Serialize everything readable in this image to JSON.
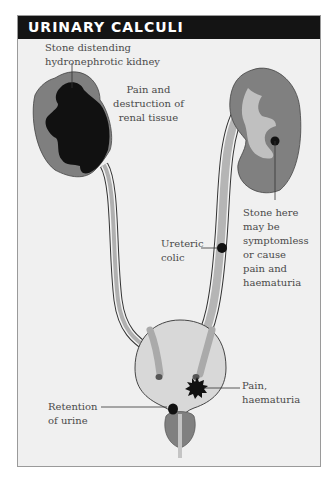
{
  "header": {
    "title": "URINARY CALCULI"
  },
  "labels": {
    "hydro_line1": "Stone distending",
    "hydro_line2": "hydronephrotic kidney",
    "pain_line1": "Pain and",
    "pain_line2": "destruction of",
    "pain_line3": "renal tissue",
    "ureteric_line1": "Ureteric",
    "ureteric_line2": "colic",
    "stone_here_line1": "Stone here",
    "stone_here_line2": "may be",
    "stone_here_line3": "symptomless",
    "stone_here_line4": "or cause",
    "stone_here_line5": "pain and",
    "stone_here_line6": "haematuria",
    "bladder_pain_line1": "Pain,",
    "bladder_pain_line2": "haematuria",
    "retention_line1": "Retention",
    "retention_line2": "of urine"
  },
  "colors": {
    "header_bg": "#141414",
    "panel_bg": "#f0f0f0",
    "kidney": "#7d7d7d",
    "stone": "#111111",
    "urine": "#bdbdbd",
    "bladder": "#d6d6d6"
  }
}
